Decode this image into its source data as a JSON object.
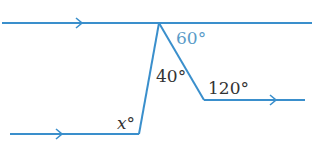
{
  "diagram": {
    "type": "parallel-lines-angles",
    "colors": {
      "line": "#3a8fcc",
      "label": "#333333",
      "highlight_label": "#5a9bc8"
    },
    "labels": {
      "angle_top_right": "60°",
      "angle_apex": "40°",
      "angle_bend": "120°",
      "angle_unknown": "x°"
    }
  }
}
